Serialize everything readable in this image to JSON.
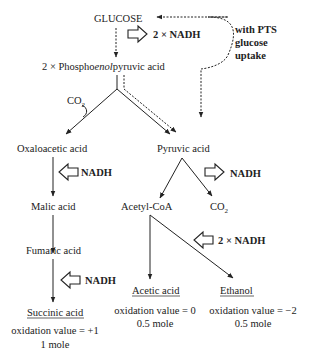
{
  "diagram": {
    "nodes": {
      "glucose": "GLUCOSE",
      "pep_prefix": "2 × Phospho",
      "pep_italic": "enol",
      "pep_suffix": "pyruvic acid",
      "oxaloacetic": "Oxaloacetic acid",
      "pyruvic": "Pyruvic acid",
      "malic": "Malic acid",
      "acetyl_coa": "Acetyl-CoA",
      "fumaric": "Fumaric acid",
      "succinic": "Succinic acid",
      "acetic": "Acetic acid",
      "ethanol": "Ethanol"
    },
    "co2": {
      "base": "CO",
      "sub": "2"
    },
    "cofactors": {
      "glycolysis": "2 × NADH",
      "pyruvate_dehydrogenase": "NADH",
      "malate": "NADH",
      "succinate": "NADH",
      "ethanol": "2 × NADH"
    },
    "pts_note": [
      "with PTS",
      "glucose",
      "uptake"
    ],
    "products": {
      "succinic": {
        "oxidation": "oxidation value = +1",
        "moles": "1 mole"
      },
      "acetic": {
        "oxidation": "oxidation value = 0",
        "moles": "0.5 mole"
      },
      "ethanol": {
        "oxidation": "oxidation value = −2",
        "moles": "0.5 mole"
      }
    }
  }
}
